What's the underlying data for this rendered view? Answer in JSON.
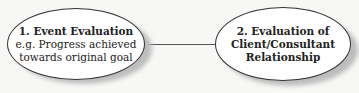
{
  "nodes": [
    {
      "title": "1.  Event Evaluation",
      "lines": [
        "e.g. Progress achieved",
        "towards original goal"
      ]
    },
    {
      "lines_bold": [
        "2.  Evaluation of",
        "Client/Consultant",
        "Relationship"
      ]
    }
  ],
  "edges": [
    {
      "from": 0,
      "to": 1
    }
  ]
}
